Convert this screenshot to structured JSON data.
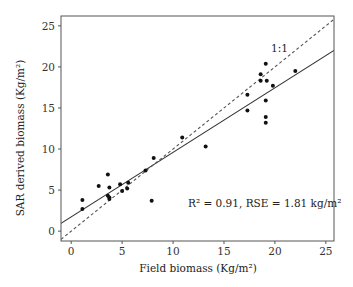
{
  "chart_data": {
    "type": "scatter",
    "title": "",
    "xlabel": "Field biomass (Kg/m²)",
    "ylabel": "SAR derived biomass (Kg/m²)",
    "xlim": [
      -1,
      25.8
    ],
    "ylim": [
      -1.2,
      26.2
    ],
    "xticks": [
      0,
      5,
      10,
      15,
      20,
      25
    ],
    "yticks": [
      0,
      5,
      10,
      15,
      20,
      25
    ],
    "grid": false,
    "legend": null,
    "points": [
      {
        "x": 1.1,
        "y": 3.8
      },
      {
        "x": 1.1,
        "y": 2.7
      },
      {
        "x": 2.7,
        "y": 5.5
      },
      {
        "x": 3.6,
        "y": 6.9
      },
      {
        "x": 3.75,
        "y": 5.3
      },
      {
        "x": 3.6,
        "y": 4.3
      },
      {
        "x": 3.75,
        "y": 4.1
      },
      {
        "x": 3.75,
        "y": 3.9
      },
      {
        "x": 4.8,
        "y": 5.7
      },
      {
        "x": 5.0,
        "y": 4.9
      },
      {
        "x": 5.6,
        "y": 5.9
      },
      {
        "x": 5.5,
        "y": 5.2
      },
      {
        "x": 7.3,
        "y": 7.4
      },
      {
        "x": 8.1,
        "y": 8.9
      },
      {
        "x": 7.9,
        "y": 3.7
      },
      {
        "x": 10.9,
        "y": 11.4
      },
      {
        "x": 13.2,
        "y": 10.3
      },
      {
        "x": 17.3,
        "y": 16.6
      },
      {
        "x": 17.3,
        "y": 14.7
      },
      {
        "x": 18.6,
        "y": 19.1
      },
      {
        "x": 18.6,
        "y": 18.3
      },
      {
        "x": 19.1,
        "y": 20.4
      },
      {
        "x": 19.2,
        "y": 18.3
      },
      {
        "x": 19.1,
        "y": 15.9
      },
      {
        "x": 19.1,
        "y": 13.9
      },
      {
        "x": 19.1,
        "y": 13.2
      },
      {
        "x": 19.8,
        "y": 17.7
      },
      {
        "x": 22.0,
        "y": 19.5
      }
    ],
    "lines": [
      {
        "name": "Regression fit",
        "style": "solid",
        "slope": 0.786,
        "intercept": 1.73
      },
      {
        "name": "1:1",
        "style": "dashed",
        "slope": 1.0,
        "intercept": 0.0
      }
    ],
    "annotations": [
      {
        "text": "1:1",
        "x": 19.5,
        "y": 22.6
      },
      {
        "text": "R² = 0.91, RSE = 1.81 kg/m²",
        "x": 11.5,
        "y": 2.9
      }
    ]
  },
  "labels": {
    "xlabel": "Field biomass (Kg/m²)",
    "ylabel": "SAR derived biomass (Kg/m²)",
    "one_to_one": "1:1",
    "stats": "R² = 0.91, RSE = 1.81 kg/m²"
  }
}
